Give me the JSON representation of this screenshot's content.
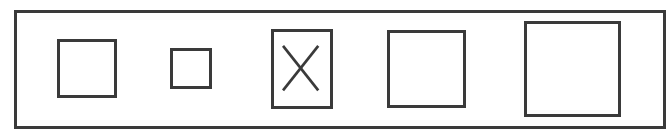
{
  "diagram": {
    "stroke_color": "#3a3a3a",
    "background": "#ffffff",
    "shapes": [
      {
        "id": 1,
        "type": "square",
        "marked": false
      },
      {
        "id": 2,
        "type": "square-small",
        "marked": false
      },
      {
        "id": 3,
        "type": "rectangle",
        "marked": true,
        "mark": "X"
      },
      {
        "id": 4,
        "type": "square",
        "marked": false
      },
      {
        "id": 5,
        "type": "square-large",
        "marked": false
      }
    ]
  }
}
